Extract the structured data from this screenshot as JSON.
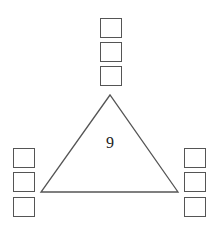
{
  "diagram": {
    "center_value": "9",
    "shape": "triangle",
    "stroke_color": "#555555",
    "box_groups": [
      {
        "position": "top",
        "count": 3,
        "values": [
          "",
          "",
          ""
        ]
      },
      {
        "position": "bottom-left",
        "count": 3,
        "values": [
          "",
          "",
          ""
        ]
      },
      {
        "position": "bottom-right",
        "count": 3,
        "values": [
          "",
          "",
          ""
        ]
      }
    ]
  }
}
